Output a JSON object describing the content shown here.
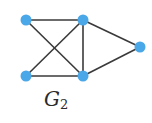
{
  "graph": {
    "label_main": "G",
    "label_sub": "2",
    "colors": {
      "node": "#4aa7e8",
      "edge": "#3a3a3a"
    },
    "nodes": [
      {
        "id": "A",
        "x": 26,
        "y": 20
      },
      {
        "id": "B",
        "x": 83,
        "y": 20
      },
      {
        "id": "C",
        "x": 140,
        "y": 47
      },
      {
        "id": "D",
        "x": 26,
        "y": 76
      },
      {
        "id": "E",
        "x": 83,
        "y": 76
      }
    ],
    "edges": [
      [
        "A",
        "B"
      ],
      [
        "A",
        "E"
      ],
      [
        "B",
        "D"
      ],
      [
        "B",
        "E"
      ],
      [
        "B",
        "C"
      ],
      [
        "D",
        "E"
      ],
      [
        "E",
        "C"
      ]
    ]
  }
}
